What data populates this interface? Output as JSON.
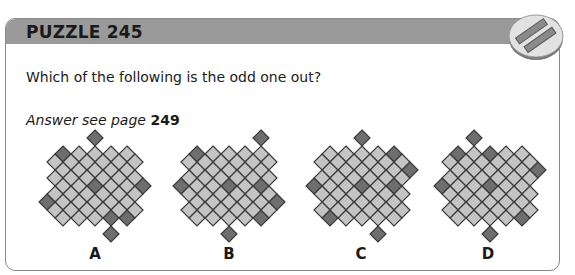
{
  "puzzle": {
    "title": "PUZZLE 245",
    "question": "Which of the following is the odd one out?",
    "answer_prefix": "Answer see page ",
    "answer_page": "249"
  },
  "colors": {
    "header": "#9a9a9a",
    "light_cell": "#c4c4c4",
    "dark_cell": "#6e6e6e",
    "cell_border": "#3a3a3a"
  },
  "badge_icon": "two-bars-icon",
  "options": [
    {
      "label": "A",
      "dark": [
        [
          0,
          0
        ],
        [
          2,
          2
        ],
        [
          3,
          4
        ],
        [
          4,
          4
        ]
      ],
      "external": [
        [
          2,
          -1
        ],
        [
          5,
          2
        ],
        [
          -1,
          3
        ],
        [
          3,
          5
        ]
      ]
    },
    {
      "label": "B",
      "dark": [
        [
          0,
          0
        ],
        [
          2,
          2
        ],
        [
          4,
          2
        ],
        [
          4,
          4
        ]
      ],
      "external": [
        [
          4,
          -1
        ],
        [
          -1,
          2
        ],
        [
          5,
          3
        ],
        [
          2,
          5
        ]
      ]
    },
    {
      "label": "C",
      "dark": [
        [
          4,
          0
        ],
        [
          2,
          2
        ],
        [
          4,
          2
        ],
        [
          0,
          4
        ]
      ],
      "external": [
        [
          2,
          -1
        ],
        [
          5,
          1
        ],
        [
          -1,
          2
        ],
        [
          3,
          5
        ]
      ]
    },
    {
      "label": "D",
      "dark": [
        [
          0,
          0
        ],
        [
          2,
          0
        ],
        [
          2,
          2
        ],
        [
          4,
          4
        ]
      ],
      "external": [
        [
          1,
          -1
        ],
        [
          5,
          1
        ],
        [
          -1,
          2
        ],
        [
          2,
          5
        ]
      ]
    }
  ]
}
